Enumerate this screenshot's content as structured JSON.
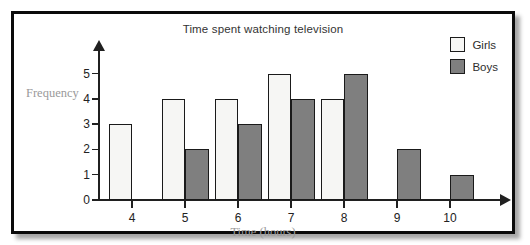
{
  "chart_data": {
    "type": "bar",
    "title": "Time spent watching television",
    "xlabel": "Time (hours)",
    "ylabel": "Frequency",
    "categories": [
      "4",
      "5",
      "6",
      "7",
      "8",
      "9",
      "10"
    ],
    "series": [
      {
        "name": "Girls",
        "color": "#f6f6f4",
        "values": [
          3,
          4,
          4,
          5,
          4,
          0,
          0
        ]
      },
      {
        "name": "Boys",
        "color": "#7f7f7f",
        "values": [
          0,
          2,
          3,
          4,
          5,
          2,
          1
        ]
      }
    ],
    "ylim": [
      0,
      5
    ],
    "yticks": [
      "0",
      "1",
      "2",
      "3",
      "4",
      "5"
    ],
    "grid": false,
    "legend_position": "top-right"
  },
  "legend": {
    "items": [
      {
        "label": "Girls",
        "swatch": "#f6f6f4"
      },
      {
        "label": "Boys",
        "swatch": "#7f7f7f"
      }
    ]
  },
  "colors": {
    "girls": "#f6f6f4",
    "boys": "#7f7f7f",
    "axis": "#202020",
    "axis_title": "#9a9a9a",
    "frame": "#0b0b0b"
  }
}
